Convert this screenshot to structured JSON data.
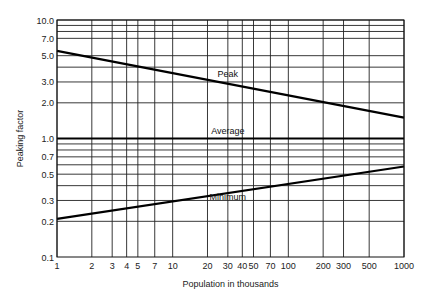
{
  "chart_data": {
    "type": "line",
    "title": "",
    "xlabel": "Population in thousands",
    "ylabel": "Peaking factor",
    "xscale": "log",
    "yscale": "log",
    "xlim": [
      1,
      1000
    ],
    "ylim": [
      0.1,
      10.0
    ],
    "grid": true,
    "x_ticks": [
      1,
      2,
      3,
      4,
      5,
      7,
      10,
      20,
      30,
      40,
      50,
      70,
      100,
      200,
      300,
      500,
      1000
    ],
    "x_tick_labels": [
      "1",
      "2",
      "3",
      "4",
      "5",
      "7",
      "10",
      "20",
      "30",
      "40",
      "50",
      "70",
      "100",
      "200",
      "300",
      "500",
      "1000"
    ],
    "y_ticks": [
      0.1,
      0.2,
      0.3,
      0.5,
      0.7,
      1.0,
      2.0,
      3.0,
      5.0,
      7.0,
      10.0
    ],
    "y_tick_labels": [
      "0.1",
      "0.2",
      "0.3",
      "0.5",
      "0.7",
      "1.0",
      "2.0",
      "3.0",
      "5.0",
      "7.0",
      "10.0"
    ],
    "y_gridlines": [
      0.2,
      0.3,
      0.4,
      0.5,
      0.6,
      0.7,
      0.8,
      0.9,
      1.0,
      2.0,
      3.0,
      4.0,
      5.0,
      7.0,
      8.0,
      9.0,
      10.0
    ],
    "series": [
      {
        "name": "Peak",
        "x": [
          1,
          1000
        ],
        "values": [
          5.5,
          1.5
        ],
        "label_at": [
          30,
          3.3
        ]
      },
      {
        "name": "Average",
        "x": [
          1,
          1000
        ],
        "values": [
          1.0,
          1.0
        ],
        "label_at": [
          30,
          1.1
        ]
      },
      {
        "name": "Minimum",
        "x": [
          1,
          1000
        ],
        "values": [
          0.21,
          0.58
        ],
        "label_at": [
          30,
          0.3
        ]
      }
    ]
  }
}
